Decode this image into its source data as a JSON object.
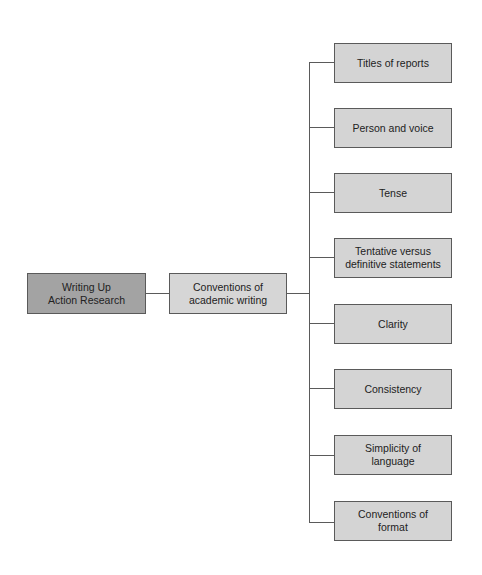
{
  "diagram": {
    "root": {
      "label": "Writing Up\nAction Research",
      "color": "#a3a3a3"
    },
    "middle": {
      "label": "Conventions of\nacademic writing",
      "color": "#d6d6d6"
    },
    "children": [
      {
        "label": "Titles of reports"
      },
      {
        "label": "Person and voice"
      },
      {
        "label": "Tense"
      },
      {
        "label": "Tentative versus\ndefinitive statements"
      },
      {
        "label": "Clarity"
      },
      {
        "label": "Consistency"
      },
      {
        "label": "Simplicity of\nlanguage"
      },
      {
        "label": "Conventions of\nformat"
      }
    ],
    "line_color": "#5a5a5a",
    "leaf_color": "#d4d4d4"
  }
}
